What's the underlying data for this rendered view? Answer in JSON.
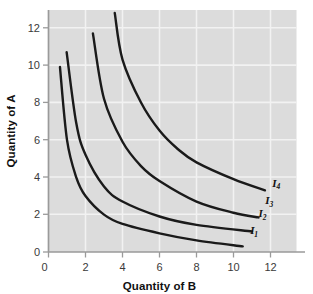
{
  "chart_data": {
    "type": "line",
    "title": "",
    "xlabel": "Quantity of B",
    "ylabel": "Quantity of A",
    "xlim": [
      0,
      13.4
    ],
    "ylim": [
      0,
      13.6
    ],
    "xticks": [
      "0",
      "2",
      "4",
      "6",
      "8",
      "10",
      "12"
    ],
    "xtick_values": [
      0,
      2,
      4,
      6,
      8,
      10,
      12
    ],
    "yticks": [
      "0",
      "2",
      "4",
      "6",
      "8",
      "10",
      "12"
    ],
    "ytick_values": [
      0,
      2,
      4,
      6,
      8,
      10,
      12
    ],
    "grid": true,
    "legend_position": "inline-right-of-curve-ends",
    "series": [
      {
        "name": "I1",
        "label_text": "I",
        "label_sub": "1",
        "label_x": 10.9,
        "label_y": 0.95,
        "curve_k": 6.0,
        "x_start": 0.62,
        "x_end": 10.5,
        "points": [
          {
            "x": 0.62,
            "y": 9.9
          },
          {
            "x": 1.0,
            "y": 6.0
          },
          {
            "x": 1.5,
            "y": 4.0
          },
          {
            "x": 2.0,
            "y": 3.0
          },
          {
            "x": 3.0,
            "y": 2.0
          },
          {
            "x": 4.0,
            "y": 1.5
          },
          {
            "x": 6.0,
            "y": 1.0
          },
          {
            "x": 8.0,
            "y": 0.62
          },
          {
            "x": 10.5,
            "y": 0.3
          }
        ]
      },
      {
        "name": "I2",
        "label_text": "I",
        "label_sub": "2",
        "label_x": 11.35,
        "label_y": 1.85,
        "curve_k": 10.0,
        "x_start": 0.98,
        "x_end": 11.0,
        "points": [
          {
            "x": 0.98,
            "y": 10.7
          },
          {
            "x": 1.5,
            "y": 6.9
          },
          {
            "x": 2.0,
            "y": 5.2
          },
          {
            "x": 3.0,
            "y": 3.5
          },
          {
            "x": 4.0,
            "y": 2.7
          },
          {
            "x": 6.0,
            "y": 1.9
          },
          {
            "x": 8.0,
            "y": 1.45
          },
          {
            "x": 11.0,
            "y": 1.1
          }
        ]
      },
      {
        "name": "I3",
        "label_text": "I",
        "label_sub": "3",
        "label_x": 11.72,
        "label_y": 2.55,
        "curve_k": 22.0,
        "x_start": 2.4,
        "x_end": 11.35,
        "points": [
          {
            "x": 2.4,
            "y": 11.7
          },
          {
            "x": 3.0,
            "y": 8.2
          },
          {
            "x": 4.0,
            "y": 5.9
          },
          {
            "x": 5.0,
            "y": 4.6
          },
          {
            "x": 6.0,
            "y": 3.8
          },
          {
            "x": 8.0,
            "y": 2.7
          },
          {
            "x": 10.0,
            "y": 2.1
          },
          {
            "x": 11.35,
            "y": 1.85
          }
        ]
      },
      {
        "name": "I4",
        "label_text": "I",
        "label_sub": "4",
        "label_x": 12.1,
        "label_y": 3.5,
        "curve_k": 40.0,
        "x_start": 3.58,
        "x_end": 11.7,
        "points": [
          {
            "x": 3.58,
            "y": 12.8
          },
          {
            "x": 4.0,
            "y": 10.3
          },
          {
            "x": 5.0,
            "y": 8.0
          },
          {
            "x": 6.0,
            "y": 6.5
          },
          {
            "x": 7.0,
            "y": 5.5
          },
          {
            "x": 8.0,
            "y": 4.8
          },
          {
            "x": 10.0,
            "y": 3.9
          },
          {
            "x": 11.7,
            "y": 3.3
          }
        ]
      }
    ],
    "colors": {
      "curve": "#1a1a1a",
      "panel_background": "#dcdcdc",
      "gridline": "#f2f2f2",
      "axis": "#9a9a9a",
      "text": "#111111",
      "tick_text": "#3a3a3a",
      "page_background": "#ffffff"
    }
  }
}
